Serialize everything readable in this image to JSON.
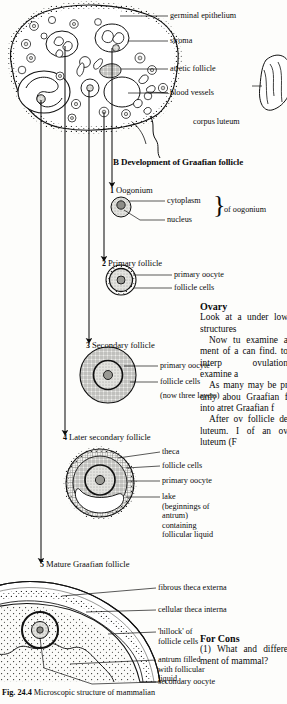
{
  "figure": {
    "caption_label": "Fig. 24.4",
    "caption_text": "Microscopic structure of mammalian"
  },
  "part_a": {
    "labels": [
      {
        "id": "germinal-epithelium",
        "text": "germinal epithelium"
      },
      {
        "id": "stroma",
        "text": "stroma"
      },
      {
        "id": "atretic-follicle",
        "text": "atretic follicle"
      },
      {
        "id": "blood-vessels",
        "text": "blood vessels"
      },
      {
        "id": "corpus-luteum",
        "text": "corpus luteum"
      }
    ]
  },
  "part_b": {
    "heading": "B Development of Graafian follicle",
    "stages": [
      {
        "number": "1",
        "name": "Oogonium",
        "labels": [
          "cytoplasm",
          "nucleus"
        ],
        "group_label": "of oogonium"
      },
      {
        "number": "2",
        "name": "Primary follicle",
        "labels": [
          "primary oocyte",
          "follicle cells"
        ]
      },
      {
        "number": "3",
        "name": "Secondary follicle",
        "labels": [
          "primary oocyte",
          "follicle cells",
          "(now three layers)"
        ]
      },
      {
        "number": "4",
        "name": "Later secondary follicle",
        "labels": [
          "theca",
          "follicle cells",
          "primary oocyte",
          "lake (beginnings of antrum) containing follicular liquid"
        ]
      },
      {
        "number": "5",
        "name": "Mature Graafian follicle",
        "labels": [
          "fibrous theca externa",
          "cellular theca interna",
          "'hillock' of follicle cells",
          "antrum filled with follicular liquid",
          "secondary oocyte"
        ]
      }
    ]
  },
  "text_column": {
    "ovary_heading": "Ovary",
    "para1": "Look at a under low structures",
    "para2": "Now tu examine a ment of a can find. to interp ovulation examine a",
    "para3": "As many may be pr only abou Graafian f into atret Graafian f",
    "para4": "After ov follicle de luteum. I of an ov luteum (F",
    "consideration_heading": "For Cons",
    "consideration_text": "(1) What and differe ment of mammal?",
    "bold_terms": [
      "atret",
      "luteum"
    ]
  },
  "colors": {
    "ink": "#0b0b0b",
    "paper": "#fdfdfb",
    "fill_light": "#d8d8d4",
    "fill_mid": "#b9b9b4"
  }
}
